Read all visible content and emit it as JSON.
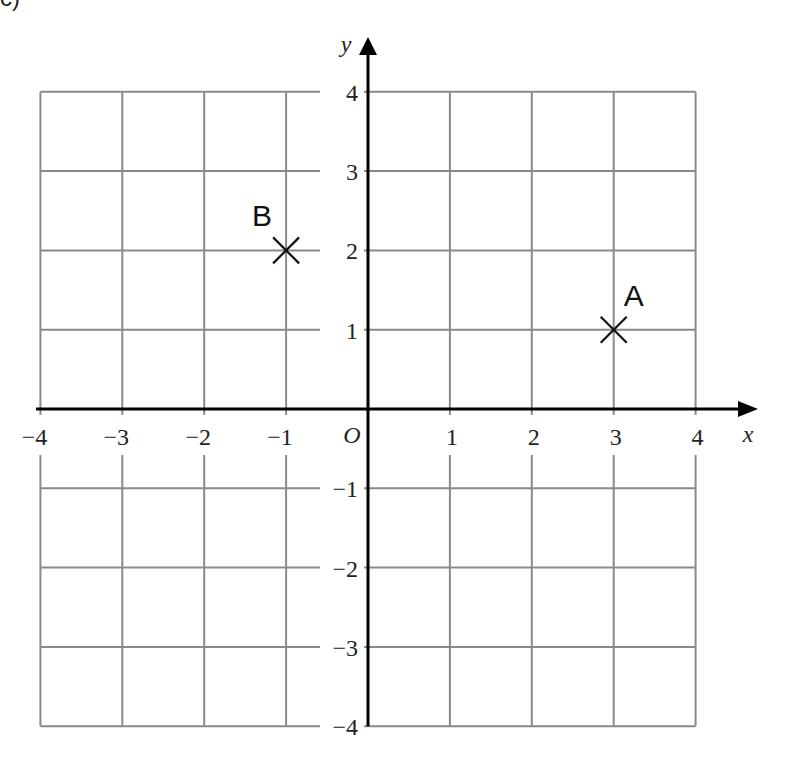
{
  "header": {
    "fragment_text": "c)"
  },
  "chart_data": {
    "type": "scatter",
    "title": "",
    "xlabel": "x",
    "ylabel": "y",
    "origin_label": "O",
    "xlim": [
      -4,
      4
    ],
    "ylim": [
      -4,
      4
    ],
    "grid": true,
    "x_ticks": [
      -4,
      -3,
      -2,
      -1,
      1,
      2,
      3,
      4
    ],
    "x_tick_labels": [
      "−4",
      "−3",
      "−2",
      "−1",
      "1",
      "2",
      "3",
      "4"
    ],
    "y_ticks": [
      4,
      3,
      2,
      1,
      -1,
      -2,
      -3,
      -4
    ],
    "y_tick_labels": [
      "4",
      "3",
      "2",
      "1",
      "−1",
      "−2",
      "−3",
      "−4"
    ],
    "points": [
      {
        "label": "A",
        "x": 3,
        "y": 1,
        "marker": "cross"
      },
      {
        "label": "B",
        "x": -1,
        "y": 2,
        "marker": "cross"
      }
    ]
  }
}
